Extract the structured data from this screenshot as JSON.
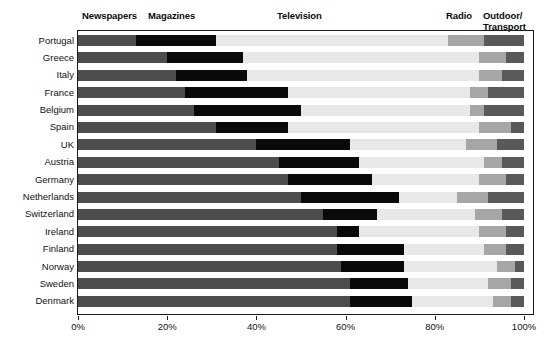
{
  "chart_data": {
    "type": "bar",
    "subtype": "stacked-horizontal-100-percent",
    "title": "",
    "xlabel": "",
    "ylabel": "",
    "xlim": [
      0,
      100
    ],
    "grid": false,
    "legend_position": "top",
    "x_ticks": [
      "0%",
      "20%",
      "40%",
      "60%",
      "80%",
      "100%"
    ],
    "x_tick_values": [
      0,
      20,
      40,
      60,
      80,
      100
    ],
    "series_labels": [
      "Newspapers",
      "Magazines",
      "Television",
      "Radio",
      "Outdoor/\nTransport"
    ],
    "series_colors": [
      "#4d4d4d",
      "#0a0a0a",
      "#e8e8e8",
      "#a6a6a6",
      "#595959"
    ],
    "categories": [
      "Portugal",
      "Greece",
      "Italy",
      "France",
      "Belgium",
      "Spain",
      "UK",
      "Austria",
      "Germany",
      "Netherlands",
      "Switzerland",
      "Ireland",
      "Finland",
      "Norway",
      "Sweden",
      "Denmark"
    ],
    "series": [
      {
        "name": "Newspapers",
        "values": [
          13,
          20,
          22,
          24,
          26,
          31,
          40,
          45,
          47,
          50,
          55,
          58,
          58,
          59,
          61,
          61
        ]
      },
      {
        "name": "Magazines",
        "values": [
          18,
          17,
          16,
          23,
          24,
          16,
          21,
          18,
          19,
          22,
          12,
          5,
          15,
          14,
          13,
          14
        ]
      },
      {
        "name": "Television",
        "values": [
          52,
          53,
          52,
          41,
          38,
          43,
          26,
          28,
          24,
          13,
          22,
          27,
          18,
          21,
          18,
          18
        ]
      },
      {
        "name": "Radio",
        "values": [
          8,
          6,
          5,
          4,
          3,
          7,
          7,
          4,
          6,
          7,
          6,
          6,
          5,
          4,
          5,
          4
        ]
      },
      {
        "name": "Outdoor/Transport",
        "values": [
          9,
          4,
          5,
          8,
          9,
          3,
          6,
          5,
          4,
          8,
          5,
          4,
          4,
          2,
          3,
          3
        ]
      }
    ],
    "rows": [
      {
        "label": "Portugal",
        "values": [
          13,
          18,
          52,
          8,
          9
        ]
      },
      {
        "label": "Greece",
        "values": [
          20,
          17,
          53,
          6,
          4
        ]
      },
      {
        "label": "Italy",
        "values": [
          22,
          16,
          52,
          5,
          5
        ]
      },
      {
        "label": "France",
        "values": [
          24,
          23,
          41,
          4,
          8
        ]
      },
      {
        "label": "Belgium",
        "values": [
          26,
          24,
          38,
          3,
          9
        ]
      },
      {
        "label": "Spain",
        "values": [
          31,
          16,
          43,
          7,
          3
        ]
      },
      {
        "label": "UK",
        "values": [
          40,
          21,
          26,
          7,
          6
        ]
      },
      {
        "label": "Austria",
        "values": [
          45,
          18,
          28,
          4,
          5
        ]
      },
      {
        "label": "Germany",
        "values": [
          47,
          19,
          24,
          6,
          4
        ]
      },
      {
        "label": "Netherlands",
        "values": [
          50,
          22,
          13,
          7,
          8
        ]
      },
      {
        "label": "Switzerland",
        "values": [
          55,
          12,
          22,
          6,
          5
        ]
      },
      {
        "label": "Ireland",
        "values": [
          58,
          5,
          27,
          6,
          4
        ]
      },
      {
        "label": "Finland",
        "values": [
          58,
          15,
          18,
          5,
          4
        ]
      },
      {
        "label": "Norway",
        "values": [
          59,
          14,
          21,
          4,
          2
        ]
      },
      {
        "label": "Sweden",
        "values": [
          61,
          13,
          18,
          5,
          3
        ]
      },
      {
        "label": "Denmark",
        "values": [
          61,
          14,
          18,
          4,
          3
        ]
      }
    ],
    "header_positions": [
      {
        "label": "Newspapers",
        "left": 82
      },
      {
        "label": "Magazines",
        "left": 148
      },
      {
        "label": "Television",
        "left": 277
      },
      {
        "label": "Radio",
        "left": 446
      },
      {
        "label": "Outdoor/\nTransport",
        "left": 483
      }
    ]
  }
}
